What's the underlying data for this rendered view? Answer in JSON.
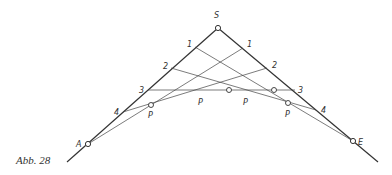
{
  "figure": {
    "caption": "Abb. 28",
    "apex_label": "S",
    "start_label": "A",
    "end_label": "E",
    "left_divisions": [
      "1",
      "2",
      "3",
      "4"
    ],
    "right_divisions": [
      "1",
      "2",
      "3",
      "4"
    ],
    "curve_point_label": "P",
    "curve_points_count": 4,
    "stroke_color": "#333333"
  }
}
